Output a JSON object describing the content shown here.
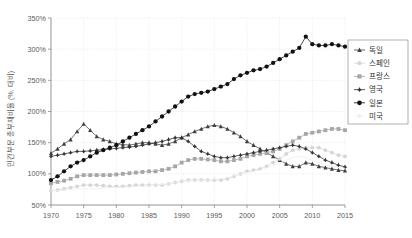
{
  "chart_data": {
    "type": "line",
    "title": "",
    "subtitle": "",
    "xlabel": "",
    "ylabel": "민간부문 총부채비율 (%, 대비)",
    "xlim": [
      1970,
      2015
    ],
    "ylim": [
      50,
      350
    ],
    "grid": true,
    "legend_position": "right",
    "x_ticks": [
      "1970",
      "1975",
      "1980",
      "1985",
      "1990",
      "1995",
      "2000",
      "2005",
      "2010",
      "2015"
    ],
    "x_tick_values": [
      1970,
      1975,
      1980,
      1985,
      1990,
      1995,
      2000,
      2005,
      2010,
      2015
    ],
    "y_ticks": [
      "50%",
      "100%",
      "150%",
      "200%",
      "250%",
      "300%",
      "350%"
    ],
    "y_tick_values": [
      50,
      100,
      150,
      200,
      250,
      300,
      350
    ],
    "x": [
      1970,
      1971,
      1972,
      1973,
      1974,
      1975,
      1976,
      1977,
      1978,
      1979,
      1980,
      1981,
      1982,
      1983,
      1984,
      1985,
      1986,
      1987,
      1988,
      1989,
      1990,
      1991,
      1992,
      1993,
      1994,
      1995,
      1996,
      1997,
      1998,
      1999,
      2000,
      2001,
      2002,
      2003,
      2004,
      2005,
      2006,
      2007,
      2008,
      2009,
      2010,
      2011,
      2012,
      2013,
      2014,
      2015
    ],
    "series": [
      {
        "name": "독일",
        "marker": "triangle",
        "color": "#404040",
        "values": [
          133,
          140,
          148,
          155,
          168,
          180,
          170,
          160,
          155,
          152,
          148,
          147,
          146,
          148,
          150,
          150,
          148,
          146,
          148,
          152,
          158,
          163,
          168,
          172,
          176,
          178,
          176,
          172,
          166,
          160,
          152,
          146,
          140,
          134,
          128,
          122,
          116,
          112,
          112,
          118,
          116,
          112,
          110,
          108,
          106,
          105
        ]
      },
      {
        "name": "스페인",
        "marker": "circle-open",
        "color": "#d5d5d5",
        "values": [
          73,
          74,
          76,
          78,
          80,
          82,
          82,
          82,
          81,
          80,
          80,
          80,
          81,
          82,
          82,
          82,
          82,
          82,
          84,
          86,
          88,
          90,
          90,
          90,
          90,
          90,
          90,
          92,
          96,
          100,
          104,
          106,
          108,
          112,
          118,
          124,
          132,
          138,
          140,
          142,
          142,
          142,
          138,
          134,
          130,
          128
        ]
      },
      {
        "name": "프랑스",
        "marker": "square",
        "color": "#a6a6a6",
        "values": [
          85,
          87,
          89,
          92,
          96,
          98,
          98,
          98,
          98,
          98,
          99,
          100,
          101,
          102,
          103,
          104,
          104,
          106,
          108,
          112,
          118,
          122,
          124,
          124,
          123,
          122,
          120,
          120,
          122,
          124,
          128,
          130,
          132,
          134,
          136,
          140,
          146,
          152,
          158,
          164,
          166,
          168,
          170,
          172,
          172,
          170
        ]
      },
      {
        "name": "영국",
        "marker": "star",
        "color": "#333333",
        "values": [
          128,
          130,
          132,
          134,
          136,
          136,
          137,
          138,
          139,
          140,
          141,
          142,
          143,
          144,
          146,
          148,
          150,
          152,
          155,
          158,
          158,
          152,
          144,
          136,
          132,
          128,
          126,
          126,
          128,
          130,
          132,
          134,
          136,
          138,
          140,
          142,
          144,
          146,
          144,
          140,
          134,
          128,
          122,
          118,
          114,
          111
        ]
      },
      {
        "name": "일본",
        "marker": "circle-filled",
        "color": "#111111",
        "values": [
          90,
          96,
          104,
          112,
          118,
          122,
          128,
          134,
          138,
          142,
          146,
          152,
          158,
          164,
          170,
          176,
          184,
          192,
          200,
          208,
          216,
          224,
          228,
          230,
          232,
          236,
          240,
          244,
          252,
          258,
          262,
          266,
          268,
          272,
          278,
          284,
          290,
          296,
          302,
          320,
          308,
          306,
          306,
          308,
          306,
          304
        ]
      },
      {
        "name": "미국",
        "marker": "none",
        "color": "#efefef",
        "values": [
          73,
          73,
          74,
          75,
          76,
          76,
          76,
          76,
          77,
          78,
          78,
          78,
          79,
          80,
          80,
          81,
          82,
          83,
          84,
          86,
          88,
          89,
          89,
          89,
          90,
          91,
          92,
          94,
          97,
          100,
          102,
          104,
          106,
          110,
          113,
          117,
          122,
          126,
          128,
          126,
          122,
          118,
          114,
          112,
          110,
          109
        ]
      }
    ]
  },
  "legend": {
    "items": [
      {
        "label": "독일"
      },
      {
        "label": "스페인"
      },
      {
        "label": "프랑스"
      },
      {
        "label": "영국"
      },
      {
        "label": "일본"
      },
      {
        "label": "미국"
      }
    ]
  }
}
